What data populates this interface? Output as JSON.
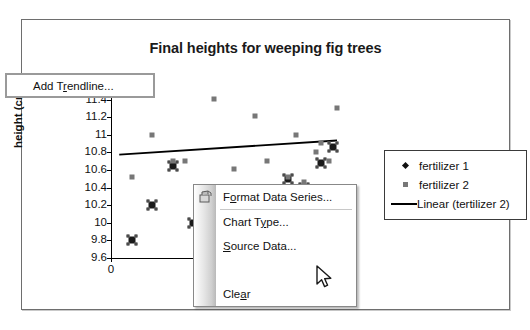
{
  "chart_data": {
    "type": "scatter",
    "title": "Final heights for weeping fig trees",
    "xlabel": "plant",
    "ylabel": "height (cm)",
    "xlim": [
      0,
      11
    ],
    "ylim": [
      9.6,
      11.6
    ],
    "ytick_labels": [
      "11.6",
      "11.4",
      "11.2",
      "11",
      "10.8",
      "10.6",
      "10.4",
      "10.2",
      "10",
      "9.8",
      "9.6"
    ],
    "ytick_values": [
      11.6,
      11.4,
      11.2,
      11.0,
      10.8,
      10.6,
      10.4,
      10.2,
      10.0,
      9.8,
      9.6
    ],
    "xtick_labels": [
      "0",
      "5"
    ],
    "xtick_values": [
      0,
      5
    ],
    "grid": false,
    "legend_position": "right",
    "series": [
      {
        "name": "fertilizer 1",
        "marker": "diamond",
        "selected": true,
        "color": "#1a1a1a",
        "points": [
          {
            "x": 1,
            "y": 9.8
          },
          {
            "x": 2,
            "y": 10.2
          },
          {
            "x": 3,
            "y": 10.64
          },
          {
            "x": 4,
            "y": 10.0
          },
          {
            "x": 5,
            "y": 9.99
          },
          {
            "x": 6,
            "y": 9.89
          },
          {
            "x": 7,
            "y": 10.07
          },
          {
            "x": 8,
            "y": 10.34
          },
          {
            "x": 8.6,
            "y": 10.5
          },
          {
            "x": 9.4,
            "y": 10.4
          },
          {
            "x": 10.2,
            "y": 10.68
          },
          {
            "x": 10.8,
            "y": 10.86
          }
        ]
      },
      {
        "name": "fertilizer 2",
        "marker": "square",
        "color": "#777777",
        "points": [
          {
            "x": 1,
            "y": 10.52
          },
          {
            "x": 2,
            "y": 11.0
          },
          {
            "x": 3,
            "y": 10.7
          },
          {
            "x": 3.6,
            "y": 10.7
          },
          {
            "x": 5,
            "y": 11.41
          },
          {
            "x": 6,
            "y": 10.61
          },
          {
            "x": 7,
            "y": 11.21
          },
          {
            "x": 7.6,
            "y": 10.7
          },
          {
            "x": 8.6,
            "y": 10.52
          },
          {
            "x": 9,
            "y": 11.0
          },
          {
            "x": 9.4,
            "y": 10.46
          },
          {
            "x": 10,
            "y": 10.8
          },
          {
            "x": 10.6,
            "y": 10.7
          },
          {
            "x": 11,
            "y": 11.31
          },
          {
            "x": 10.2,
            "y": 10.91
          }
        ]
      }
    ],
    "trendline": {
      "name": "Linear (fertilizer 2)",
      "legend_label": "Linear (tertilizer 2)",
      "x_start": 0.4,
      "y_start": 10.775,
      "x_end": 11.0,
      "y_end": 10.935
    }
  },
  "legend": {
    "entries": [
      {
        "label": "fertilizer 1",
        "key": "diamond-marker-icon"
      },
      {
        "label": "fertilizer 2",
        "key": "square-marker-icon"
      },
      {
        "label": "Linear (tertilizer 2)",
        "key": "line-marker-icon"
      }
    ]
  },
  "context_menu": {
    "items": [
      {
        "label": "Format Data Series...",
        "accel": "o",
        "icon": "format-series-icon",
        "highlighted": false
      },
      {
        "label": "Chart Type...",
        "accel": "y",
        "icon": null,
        "highlighted": false
      },
      {
        "label": "Source Data...",
        "accel": "S",
        "icon": null,
        "highlighted": false
      },
      {
        "label": "Add Trendline...",
        "accel": "r",
        "icon": null,
        "highlighted": true
      },
      {
        "label": "Clear",
        "accel": "a",
        "icon": null,
        "highlighted": false
      }
    ]
  },
  "cursor": {
    "type": "arrow-pointer",
    "over_item": "Add Trendline..."
  },
  "colors": {
    "series1": "#1a1a1a",
    "series2": "#777777",
    "trendline": "#000000",
    "frame_border": "#6e6e6e",
    "menu_border": "#888888",
    "highlight_border": "#9a9a9a"
  }
}
